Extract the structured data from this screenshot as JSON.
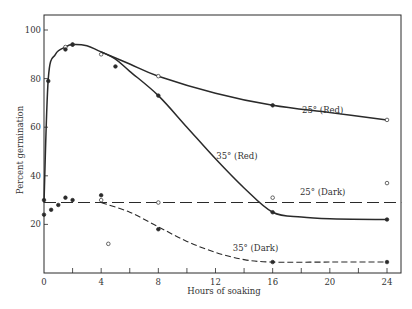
{
  "chart_data": {
    "type": "line",
    "title": "",
    "xlabel": "Hours of soaking",
    "ylabel": "Percent germination",
    "xlim": [
      0,
      25
    ],
    "ylim": [
      0,
      106
    ],
    "xticks": [
      0,
      4,
      8,
      12,
      16,
      20,
      24
    ],
    "xminor_ticks": [
      2,
      6,
      10,
      14,
      18,
      22
    ],
    "yticks": [
      20,
      40,
      60,
      80,
      100
    ],
    "ytick_labels": [
      "20",
      "40",
      "60",
      "80",
      "100"
    ],
    "xtick_labels": [
      "0",
      "4",
      "8",
      "12",
      "16",
      "20",
      "24"
    ],
    "origin_label": "0",
    "grid": false,
    "legend": "inline curve labels",
    "series": [
      {
        "name": "25° (Red)",
        "label": "25° (Red)",
        "line_style": "solid",
        "marker": "mixed",
        "curve": [
          [
            0,
            29
          ],
          [
            0.3,
            80
          ],
          [
            0.8,
            90
          ],
          [
            1.5,
            93
          ],
          [
            2,
            94
          ],
          [
            3,
            93.5
          ],
          [
            4,
            91
          ],
          [
            6,
            86
          ],
          [
            8,
            81
          ],
          [
            12,
            74
          ],
          [
            16,
            69
          ],
          [
            20,
            66
          ],
          [
            24,
            63
          ]
        ],
        "points": [
          {
            "x": 0.3,
            "y": 79,
            "marker": "filled"
          },
          {
            "x": 1.5,
            "y": 93,
            "marker": "open"
          },
          {
            "x": 2,
            "y": 94,
            "marker": "open"
          },
          {
            "x": 4,
            "y": 90,
            "marker": "open"
          },
          {
            "x": 8,
            "y": 81,
            "marker": "open"
          },
          {
            "x": 16,
            "y": 69,
            "marker": "filled"
          },
          {
            "x": 24,
            "y": 63,
            "marker": "open"
          }
        ]
      },
      {
        "name": "35° (Red)",
        "label": "35° (Red)",
        "line_style": "solid",
        "marker": "filled",
        "curve": [
          [
            4,
            91
          ],
          [
            5,
            88
          ],
          [
            6,
            83
          ],
          [
            8,
            73
          ],
          [
            10,
            60
          ],
          [
            12,
            47
          ],
          [
            14,
            35
          ],
          [
            16,
            25
          ],
          [
            18,
            23
          ],
          [
            20,
            22.3
          ],
          [
            24,
            22
          ]
        ],
        "points": [
          {
            "x": 1.5,
            "y": 92,
            "marker": "filled"
          },
          {
            "x": 2,
            "y": 94,
            "marker": "filled"
          },
          {
            "x": 5,
            "y": 85,
            "marker": "filled"
          },
          {
            "x": 8,
            "y": 73,
            "marker": "filled"
          },
          {
            "x": 16,
            "y": 25,
            "marker": "filled"
          },
          {
            "x": 24,
            "y": 22,
            "marker": "filled"
          }
        ]
      },
      {
        "name": "25° (Dark)",
        "label": "25° (Dark)",
        "line_style": "long-dash",
        "marker": "open",
        "curve": [
          [
            0,
            29
          ],
          [
            25,
            29
          ]
        ],
        "points": [
          {
            "x": 4,
            "y": 30,
            "marker": "open"
          },
          {
            "x": 8,
            "y": 29,
            "marker": "open"
          },
          {
            "x": 16,
            "y": 31,
            "marker": "open"
          },
          {
            "x": 24,
            "y": 37,
            "marker": "open"
          }
        ]
      },
      {
        "name": "35° (Dark)",
        "label": "35° (Dark)",
        "line_style": "short-dash",
        "marker": "filled",
        "curve": [
          [
            4,
            29
          ],
          [
            6,
            25
          ],
          [
            8,
            19
          ],
          [
            10,
            13
          ],
          [
            12,
            8.5
          ],
          [
            14,
            5.5
          ],
          [
            16,
            4.5
          ],
          [
            20,
            4.5
          ],
          [
            24,
            4.5
          ]
        ],
        "points": [
          {
            "x": 0,
            "y": 24,
            "marker": "filled"
          },
          {
            "x": 0.5,
            "y": 26,
            "marker": "filled"
          },
          {
            "x": 1,
            "y": 28,
            "marker": "filled"
          },
          {
            "x": 1.5,
            "y": 31,
            "marker": "filled"
          },
          {
            "x": 2,
            "y": 30,
            "marker": "filled"
          },
          {
            "x": 4,
            "y": 32,
            "marker": "filled"
          },
          {
            "x": 8,
            "y": 18,
            "marker": "filled"
          },
          {
            "x": 16,
            "y": 4.5,
            "marker": "filled"
          },
          {
            "x": 24,
            "y": 4.5,
            "marker": "filled"
          }
        ]
      }
    ],
    "stray_points": [
      {
        "x": 4.5,
        "y": 12,
        "marker": "open"
      },
      {
        "x": 0,
        "y": 30,
        "marker": "filled"
      }
    ],
    "label_positions": [
      {
        "series": "25° (Red)",
        "x": 19.5,
        "y": 66
      },
      {
        "series": "35° (Red)",
        "x": 13.5,
        "y": 47
      },
      {
        "series": "25° (Dark)",
        "x": 19.5,
        "y": 32
      },
      {
        "series": "35° (Dark)",
        "x": 14.8,
        "y": 9
      }
    ]
  }
}
